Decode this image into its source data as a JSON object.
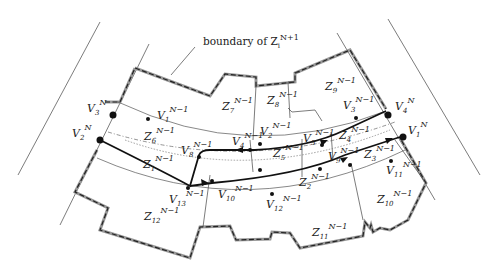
{
  "figure": {
    "boundary_label": "boundary of Z",
    "boundary_sub": "i",
    "boundary_sup": "N+1",
    "vertices_N": [
      {
        "id": "V3N",
        "base": "V",
        "sub": "3",
        "sup": "N"
      },
      {
        "id": "V2N",
        "base": "V",
        "sub": "2",
        "sup": "N"
      },
      {
        "id": "V4N",
        "base": "V",
        "sub": "4",
        "sup": "N"
      },
      {
        "id": "V1N",
        "base": "V",
        "sub": "1",
        "sup": "N"
      }
    ],
    "vertices_N1": [
      {
        "id": "V1",
        "base": "V",
        "sub": "1",
        "sup": "N−1"
      },
      {
        "id": "V2",
        "base": "V",
        "sub": "2",
        "sup": "N−1"
      },
      {
        "id": "V3",
        "base": "V",
        "sub": "3",
        "sup": "N−1"
      },
      {
        "id": "V4",
        "base": "V",
        "sub": "4",
        "sup": "N−1"
      },
      {
        "id": "V5",
        "base": "V",
        "sub": "5",
        "sup": "N−1"
      },
      {
        "id": "V8",
        "base": "V",
        "sub": "8",
        "sup": "N−1"
      },
      {
        "id": "V9",
        "base": "V",
        "sub": "9",
        "sup": "N−1"
      },
      {
        "id": "V10",
        "base": "V",
        "sub": "10",
        "sup": "N−1"
      },
      {
        "id": "V11",
        "base": "V",
        "sub": "11",
        "sup": "N−1"
      },
      {
        "id": "V12",
        "base": "V",
        "sub": "12",
        "sup": "N−1"
      },
      {
        "id": "V13",
        "base": "V",
        "sub": "13",
        "sup": "N−1"
      }
    ],
    "zones": [
      {
        "id": "Z1",
        "base": "Z",
        "sub": "1",
        "sup": "N−1"
      },
      {
        "id": "Z2",
        "base": "Z",
        "sub": "2",
        "sup": "N−1"
      },
      {
        "id": "Z3",
        "base": "Z",
        "sub": "3",
        "sup": "N−1"
      },
      {
        "id": "Z4",
        "base": "Z",
        "sub": "4",
        "sup": "N−1"
      },
      {
        "id": "Z5",
        "base": "Z",
        "sub": "5",
        "sup": "N−1"
      },
      {
        "id": "Z6",
        "base": "Z",
        "sub": "6",
        "sup": "N−1"
      },
      {
        "id": "Z7",
        "base": "Z",
        "sub": "7",
        "sup": "N−1"
      },
      {
        "id": "Z8",
        "base": "Z",
        "sub": "8",
        "sup": "N−1"
      },
      {
        "id": "Z9",
        "base": "Z",
        "sub": "9",
        "sup": "N−1"
      },
      {
        "id": "Z10",
        "base": "Z",
        "sub": "10",
        "sup": "N−1"
      },
      {
        "id": "Z11",
        "base": "Z",
        "sub": "11",
        "sup": "N−1"
      },
      {
        "id": "Z12",
        "base": "Z",
        "sub": "12",
        "sup": "N−1"
      }
    ]
  }
}
